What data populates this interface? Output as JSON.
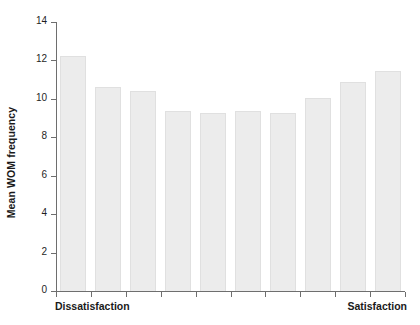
{
  "chart_data": {
    "type": "bar",
    "title": "",
    "xlabel": "",
    "ylabel": "Mean WOM frequency",
    "ylim": [
      0,
      14
    ],
    "ytick_values": [
      0,
      2,
      4,
      6,
      8,
      10,
      12,
      14
    ],
    "ytick_labels": [
      "0",
      "2",
      "4",
      "6",
      "8",
      "10",
      "12",
      "14"
    ],
    "grid": false,
    "legend": "none",
    "x_axis_endpoint_labels": {
      "left": "Dissatisfaction",
      "right": "Satisfaction"
    },
    "categories": [
      "1",
      "2",
      "3",
      "4",
      "5",
      "6",
      "7",
      "8",
      "9",
      "10"
    ],
    "values": [
      12.25,
      10.6,
      10.4,
      9.35,
      9.25,
      9.35,
      9.25,
      10.05,
      10.9,
      11.45
    ],
    "bar_fill_color": "#ececec",
    "bar_edge_color": "#e0e0e0",
    "axis_color": "#6e6e6e",
    "text_color": "#1a1a1a",
    "background_color": "#ffffff"
  }
}
